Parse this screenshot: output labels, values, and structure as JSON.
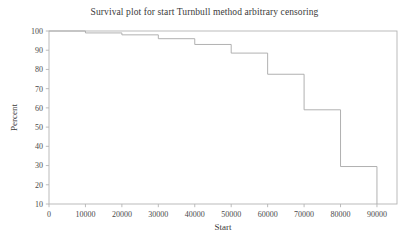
{
  "chart_data": {
    "type": "line",
    "subtype": "step-post",
    "title": "Survival plot for start Turnbull method arbitrary censoring",
    "xlabel": "Start",
    "ylabel": "Percent",
    "xlim": [
      0,
      95500
    ],
    "ylim": [
      10,
      100
    ],
    "grid": false,
    "legend": null,
    "xticks": [
      0,
      10000,
      20000,
      30000,
      40000,
      50000,
      60000,
      70000,
      80000,
      90000
    ],
    "xticklabels": [
      "0",
      "10000",
      "20000",
      "30000",
      "40000",
      "50000",
      "60000",
      "70000",
      "80000",
      "90000"
    ],
    "yticks": [
      10,
      20,
      30,
      40,
      50,
      60,
      70,
      80,
      90,
      100
    ],
    "yticklabels": [
      "10",
      "20",
      "30",
      "40",
      "50",
      "60",
      "70",
      "80",
      "90",
      "100"
    ],
    "line_color": "#a8a8a8",
    "frame_color": "#b4b4b4",
    "x": [
      0,
      10000,
      20000,
      30000,
      40000,
      50000,
      60000,
      70000,
      80000,
      90000,
      90000
    ],
    "y": [
      100,
      99,
      98,
      96,
      93,
      88.5,
      77.5,
      59,
      29.5,
      29.5,
      10
    ],
    "series": [
      {
        "name": "Turnbull survival estimate",
        "points": [
          {
            "x": 0,
            "y": 100
          },
          {
            "x": 10000,
            "y": 99
          },
          {
            "x": 20000,
            "y": 98
          },
          {
            "x": 30000,
            "y": 96
          },
          {
            "x": 40000,
            "y": 93
          },
          {
            "x": 50000,
            "y": 88.5
          },
          {
            "x": 60000,
            "y": 77.5
          },
          {
            "x": 70000,
            "y": 59
          },
          {
            "x": 80000,
            "y": 29.5
          },
          {
            "x": 90000,
            "y": 29.5
          }
        ]
      }
    ]
  }
}
